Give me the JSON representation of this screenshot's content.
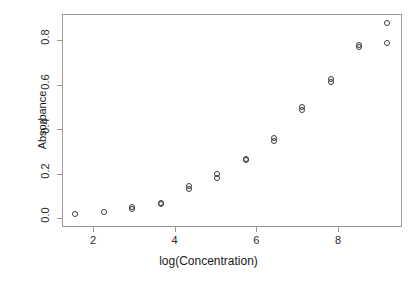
{
  "chart_data": {
    "type": "scatter",
    "title": "",
    "xlabel": "log(Concentration)",
    "ylabel": "Absorbance",
    "xlim": [
      1.23,
      9.55
    ],
    "ylim": [
      -0.01,
      0.895
    ],
    "grid": false,
    "legend": null,
    "marker": "open-circle",
    "xticks": [
      2,
      4,
      6,
      8
    ],
    "xticklabels": [
      "2",
      "4",
      "6",
      "8"
    ],
    "yticks": [
      0.0,
      0.2,
      0.4,
      0.6,
      0.8
    ],
    "yticklabels": [
      "0.0",
      "0.2",
      "0.4",
      "0.6",
      "0.8"
    ],
    "points": [
      {
        "x": 1.57,
        "y": 0.018
      },
      {
        "x": 2.26,
        "y": 0.028
      },
      {
        "x": 2.96,
        "y": 0.048
      },
      {
        "x": 2.96,
        "y": 0.042
      },
      {
        "x": 3.66,
        "y": 0.068
      },
      {
        "x": 3.66,
        "y": 0.061
      },
      {
        "x": 4.35,
        "y": 0.142
      },
      {
        "x": 4.35,
        "y": 0.131
      },
      {
        "x": 5.04,
        "y": 0.196
      },
      {
        "x": 5.04,
        "y": 0.181
      },
      {
        "x": 5.74,
        "y": 0.266
      },
      {
        "x": 5.74,
        "y": 0.259
      },
      {
        "x": 6.43,
        "y": 0.359
      },
      {
        "x": 6.43,
        "y": 0.346
      },
      {
        "x": 7.13,
        "y": 0.501
      },
      {
        "x": 7.13,
        "y": 0.487
      },
      {
        "x": 7.82,
        "y": 0.625
      },
      {
        "x": 7.82,
        "y": 0.613
      },
      {
        "x": 8.51,
        "y": 0.779
      },
      {
        "x": 8.51,
        "y": 0.769
      },
      {
        "x": 9.21,
        "y": 0.876
      },
      {
        "x": 9.21,
        "y": 0.787
      }
    ]
  }
}
